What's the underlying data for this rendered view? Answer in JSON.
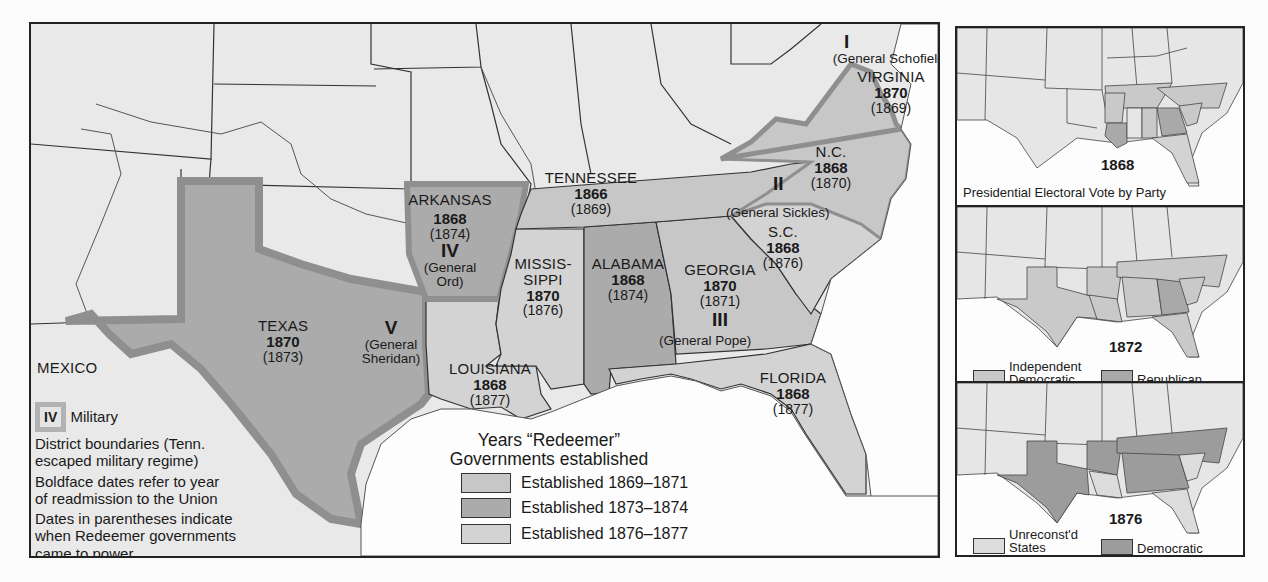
{
  "main_map": {
    "colors": {
      "background_land": "#e9e9e9",
      "water": "#fdfdfd",
      "established_1869_1871": "#c7c7c7",
      "established_1873_1874": "#ababab",
      "established_1876_1877": "#d3d3d3",
      "district_boundary": "#8f8f8f",
      "state_line": "#2a2a2a"
    },
    "states": [
      {
        "name": "VIRGINIA",
        "readmission": "1870",
        "redeemer": "(1869)"
      },
      {
        "name": "N.C.",
        "readmission": "1868",
        "redeemer": "(1870)"
      },
      {
        "name": "TENNESSEE",
        "readmission": "1866",
        "redeemer": "(1869)"
      },
      {
        "name": "ARKANSAS",
        "readmission": "1868",
        "redeemer": "(1874)"
      },
      {
        "name": "S.C.",
        "readmission": "1868",
        "redeemer": "(1876)"
      },
      {
        "name": "MISSIS-",
        "name2": "SIPPI",
        "readmission": "1870",
        "redeemer": "(1876)"
      },
      {
        "name": "ALABAMA",
        "readmission": "1868",
        "redeemer": "(1874)"
      },
      {
        "name": "GEORGIA",
        "readmission": "1870",
        "redeemer": "(1871)"
      },
      {
        "name": "TEXAS",
        "readmission": "1870",
        "redeemer": "(1873)"
      },
      {
        "name": "LOUISIANA",
        "readmission": "1868",
        "redeemer": "(1877)"
      },
      {
        "name": "FLORIDA",
        "readmission": "1868",
        "redeemer": "(1877)"
      }
    ],
    "districts": [
      {
        "numeral": "I",
        "general": "(General Schofield)"
      },
      {
        "numeral": "II",
        "general": "(General Sickles)"
      },
      {
        "numeral": "III",
        "general": "(General Pope)"
      },
      {
        "numeral": "IV",
        "general": "(General",
        "general2": "Ord)"
      },
      {
        "numeral": "V",
        "general": "(General",
        "general2": "Sheridan)"
      }
    ],
    "other_labels": {
      "mexico": "MEXICO"
    },
    "notes": {
      "iv_sample": "IV",
      "military": "Military",
      "line1": "District boundaries (Tenn.",
      "line2": "escaped military regime)",
      "line3": "Boldface dates refer to year",
      "line4": "of readmission to the Union",
      "line5": "Dates in parentheses indicate",
      "line6": "when Redeemer governments",
      "line7": "came to power"
    },
    "legend": {
      "title1": "Years “Redeemer”",
      "title2": "Governments established",
      "items": [
        {
          "label": "Established 1869–1871",
          "color": "#c7c7c7"
        },
        {
          "label": "Established 1873–1874",
          "color": "#ababab"
        },
        {
          "label": "Established 1876–1877",
          "color": "#d3d3d3"
        }
      ]
    }
  },
  "insets": [
    {
      "year": "1868",
      "caption": "Presidential Electoral Vote by Party",
      "legend": []
    },
    {
      "year": "1872",
      "caption": "",
      "legend": [
        {
          "label": "Independent",
          "label2": "Democratic",
          "color": "#c9c9c9"
        },
        {
          "label": "Republican",
          "label2": "",
          "color": "#a9a9a9"
        }
      ]
    },
    {
      "year": "1876",
      "caption": "",
      "legend": [
        {
          "label": "Unreconst'd",
          "label2": "States",
          "color": "#dcdcdc"
        },
        {
          "label": "Democratic",
          "label2": "",
          "color": "#9c9c9c"
        }
      ]
    }
  ]
}
